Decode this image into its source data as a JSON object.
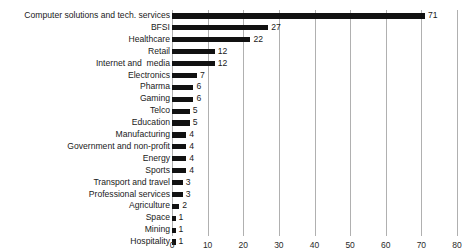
{
  "chart_data": {
    "type": "bar",
    "orientation": "horizontal",
    "title": "",
    "xlabel": "",
    "ylabel": "",
    "xlim": [
      0,
      80
    ],
    "xticks": [
      0,
      10,
      20,
      30,
      40,
      50,
      60,
      70,
      80
    ],
    "grid": "vertical",
    "legend": "none",
    "bar_color": "#111111",
    "gridline_color": "#b0b0b0",
    "background_color": "#ffffff",
    "categories": [
      "Computer solutions and tech. services",
      "BFSI",
      "Healthcare",
      "Retail",
      "Internet and  media",
      "Electronics",
      "Pharma",
      "Gaming",
      "Telco",
      "Education",
      "Manufacturing",
      "Government and non-profit",
      "Energy",
      "Sports",
      "Transport and travel",
      "Professional services",
      "Agriculture",
      "Space",
      "Mining",
      "Hospitality"
    ],
    "values": [
      71,
      27,
      22,
      12,
      12,
      7,
      6,
      6,
      5,
      5,
      4,
      4,
      4,
      4,
      3,
      3,
      2,
      1,
      1,
      1
    ],
    "data_labels": [
      "71",
      "27",
      "22",
      "12",
      "12",
      "7",
      "6",
      "6",
      "5",
      "5",
      "4",
      "4",
      "4",
      "4",
      "3",
      "3",
      "2",
      "1",
      "1",
      "1"
    ],
    "tick_labels": [
      "0",
      "10",
      "20",
      "30",
      "40",
      "50",
      "60",
      "70",
      "80"
    ]
  }
}
